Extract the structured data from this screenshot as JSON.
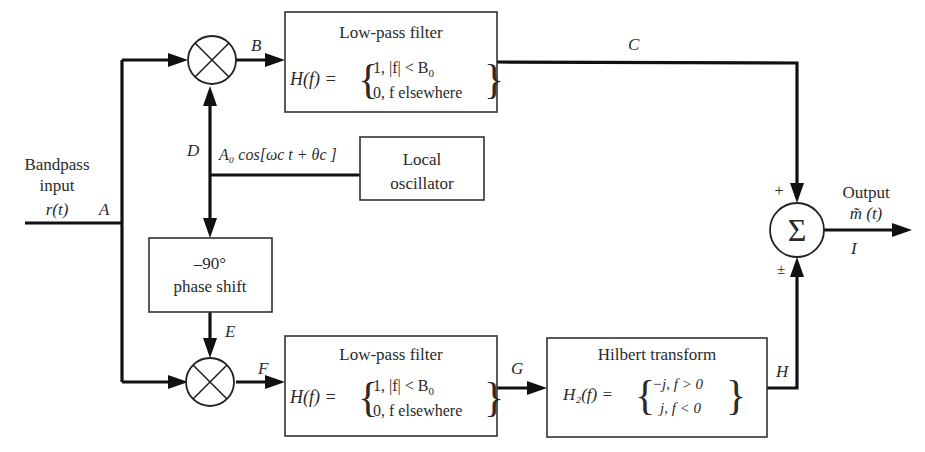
{
  "diagram": {
    "type": "block-diagram",
    "input": {
      "label_line1": "Bandpass",
      "label_line2": "input",
      "signal": "r(t)",
      "node": "A"
    },
    "output": {
      "label": "Output",
      "signal": "m̃ (t)",
      "node": "I"
    },
    "nodes": {
      "A": "A",
      "B": "B",
      "C": "C",
      "D": "D",
      "E": "E",
      "F": "F",
      "G": "G",
      "H": "H",
      "I": "I"
    },
    "blocks": {
      "lpf_top": {
        "title": "Low-pass filter",
        "eq_lhs": "H(f) =",
        "case1": "1, |f| < B",
        "case1_sub": "0",
        "case2": "0,  f elsewhere"
      },
      "lpf_bottom": {
        "title": "Low-pass filter",
        "eq_lhs": "H(f) =",
        "case1": "1, |f| < B",
        "case1_sub": "0",
        "case2": "0,  f elsewhere"
      },
      "local_oscillator": {
        "line1": "Local",
        "line2": "oscillator",
        "signal_label": "A₀ cos[ωc t + θc ]"
      },
      "phase_shift": {
        "line1": "–90°",
        "line2": "phase shift"
      },
      "hilbert": {
        "title": "Hilbert transform",
        "eq_lhs": "H₂(f) =",
        "case1": "−j, f > 0",
        "case2": "j, f < 0"
      },
      "summer": {
        "symbol": "Σ",
        "sign_top": "+",
        "sign_bottom": "±"
      },
      "mixer_top": {
        "symbol": "⊗"
      },
      "mixer_bottom": {
        "symbol": "⊗"
      }
    },
    "connections": [
      {
        "from": "input",
        "to": "mixer_top",
        "via": "A"
      },
      {
        "from": "input",
        "to": "mixer_bottom",
        "via": "A"
      },
      {
        "from": "mixer_top",
        "to": "lpf_top",
        "label": "B"
      },
      {
        "from": "lpf_top",
        "to": "summer",
        "label": "C",
        "sign": "+"
      },
      {
        "from": "local_oscillator",
        "to": "mixer_top",
        "label": "D"
      },
      {
        "from": "local_oscillator",
        "to": "phase_shift",
        "label": "D"
      },
      {
        "from": "phase_shift",
        "to": "mixer_bottom",
        "label": "E"
      },
      {
        "from": "mixer_bottom",
        "to": "lpf_bottom",
        "label": "F"
      },
      {
        "from": "lpf_bottom",
        "to": "hilbert",
        "label": "G"
      },
      {
        "from": "hilbert",
        "to": "summer",
        "label": "H",
        "sign": "±"
      },
      {
        "from": "summer",
        "to": "output",
        "label": "I"
      }
    ]
  }
}
